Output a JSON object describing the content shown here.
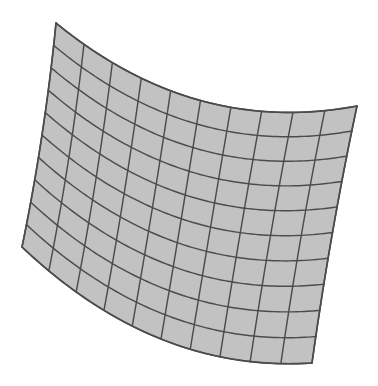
{
  "scene": {
    "title": "Curved Quadrilateral Mesh Surface",
    "description": "A warped grid patch of quadrilateral cells rendered as a shaded wireframe surface, rotated clockwise and bowed along its horizontal isolines.",
    "canvas_width": 378,
    "canvas_height": 386,
    "background_color": "#ffffff"
  },
  "surface": {
    "name": "curved-grid-patch",
    "type": "quad-mesh",
    "columns": 10,
    "rows": 10,
    "fill_color": "#c2c2c2",
    "line_color": "#4c4c4c",
    "line_width": 1.45,
    "outline_width": 1.7,
    "cell_stroke_width": 0.9,
    "corners": {
      "top_left": {
        "x": 56,
        "y": 23
      },
      "top_right": {
        "x": 357,
        "y": 106
      },
      "bottom_right": {
        "x": 312,
        "y": 363
      },
      "bottom_left": {
        "x": 22,
        "y": 247
      }
    },
    "curvature": {
      "top_edge_sag_x": -6,
      "top_edge_sag_y": 36,
      "bottom_edge_sag_x": -6,
      "bottom_edge_sag_y": 34,
      "left_edge_sag_x": 3,
      "left_edge_sag_y": 0,
      "right_edge_sag_x": -2,
      "right_edge_sag_y": -2
    }
  },
  "legend": {
    "u_axis_label": "u (columns)",
    "v_axis_label": "v (rows)",
    "cell_count_label": "100 cells"
  },
  "chart_data": {
    "type": "mesh",
    "grid": {
      "nu": 10,
      "nv": 10,
      "total_cells": 100
    },
    "corner_points": [
      {
        "label": "P00 top-left",
        "x": 56,
        "y": 23
      },
      {
        "label": "P10 top-right",
        "x": 357,
        "y": 106
      },
      {
        "label": "P11 bottom-right",
        "x": 312,
        "y": 363
      },
      {
        "label": "P01 bottom-left",
        "x": 22,
        "y": 247
      }
    ],
    "xlim": [
      0,
      378
    ],
    "ylim": [
      0,
      386
    ],
    "grid_visible": true,
    "legend_position": "none"
  }
}
